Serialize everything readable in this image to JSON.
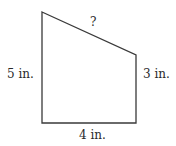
{
  "diagram": {
    "type": "trapezoid",
    "stroke_color": "#3a3a3a",
    "vertices": [
      [
        42,
        12
      ],
      [
        136,
        55
      ],
      [
        136,
        123
      ],
      [
        42,
        123
      ]
    ],
    "labels": {
      "left": "5 in.",
      "right": "3 in.",
      "bottom": "4 in.",
      "slant": "?"
    }
  }
}
